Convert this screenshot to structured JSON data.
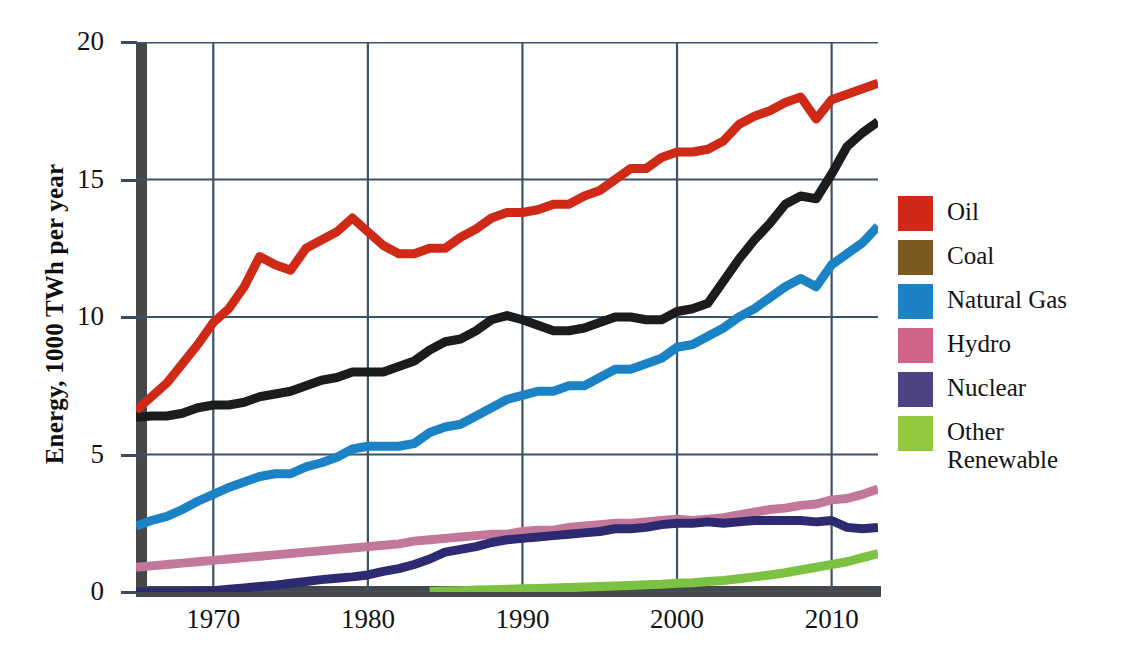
{
  "chart_data": {
    "type": "line",
    "title": "",
    "xlabel": "",
    "ylabel": "Energy, 1000 TWh per year",
    "xlim": [
      1965,
      2013
    ],
    "ylim": [
      0,
      20
    ],
    "grid": true,
    "legend_position": "right",
    "xticks": [
      "1970",
      "1980",
      "1990",
      "2000",
      "2010"
    ],
    "xtick_values": [
      1970,
      1980,
      1990,
      2000,
      2010
    ],
    "yticks": [
      "0",
      "5",
      "10",
      "15",
      "20"
    ],
    "ytick_values": [
      0,
      5,
      10,
      15,
      20
    ],
    "x": [
      1965,
      1966,
      1967,
      1968,
      1969,
      1970,
      1971,
      1972,
      1973,
      1974,
      1975,
      1976,
      1977,
      1978,
      1979,
      1980,
      1981,
      1982,
      1983,
      1984,
      1985,
      1986,
      1987,
      1988,
      1989,
      1990,
      1991,
      1992,
      1993,
      1994,
      1995,
      1996,
      1997,
      1998,
      1999,
      2000,
      2001,
      2002,
      2003,
      2004,
      2005,
      2006,
      2007,
      2008,
      2009,
      2010,
      2011,
      2012,
      2013
    ],
    "series": [
      {
        "name": "Oil",
        "color": "#cf2a18",
        "values": [
          6.6,
          7.1,
          7.6,
          8.3,
          9.0,
          9.8,
          10.3,
          11.1,
          12.2,
          11.9,
          11.7,
          12.5,
          12.8,
          13.1,
          13.6,
          13.1,
          12.6,
          12.3,
          12.3,
          12.5,
          12.5,
          12.9,
          13.2,
          13.6,
          13.8,
          13.8,
          13.9,
          14.1,
          14.1,
          14.4,
          14.6,
          15.0,
          15.4,
          15.4,
          15.8,
          16.0,
          16.0,
          16.1,
          16.4,
          17.0,
          17.3,
          17.5,
          17.8,
          18.0,
          17.2,
          17.9,
          18.1,
          18.3,
          18.5
        ]
      },
      {
        "name": "Coal",
        "color": "#1c1c1e",
        "values": [
          6.35,
          6.4,
          6.4,
          6.5,
          6.7,
          6.8,
          6.8,
          6.9,
          7.1,
          7.2,
          7.3,
          7.5,
          7.7,
          7.8,
          8.0,
          8.0,
          8.0,
          8.2,
          8.4,
          8.8,
          9.1,
          9.2,
          9.5,
          9.9,
          10.05,
          9.9,
          9.7,
          9.5,
          9.5,
          9.6,
          9.8,
          10.0,
          10.0,
          9.9,
          9.9,
          10.2,
          10.3,
          10.5,
          11.3,
          12.1,
          12.8,
          13.4,
          14.1,
          14.4,
          14.3,
          15.2,
          16.2,
          16.7,
          17.1
        ]
      },
      {
        "name": "Natural Gas",
        "color": "#1b82c5",
        "values": [
          2.4,
          2.6,
          2.75,
          3.0,
          3.3,
          3.55,
          3.8,
          4.0,
          4.2,
          4.3,
          4.3,
          4.55,
          4.7,
          4.9,
          5.2,
          5.3,
          5.3,
          5.3,
          5.4,
          5.8,
          6.0,
          6.1,
          6.4,
          6.7,
          7.0,
          7.15,
          7.3,
          7.3,
          7.5,
          7.5,
          7.8,
          8.1,
          8.1,
          8.3,
          8.5,
          8.9,
          9.0,
          9.3,
          9.6,
          10.0,
          10.3,
          10.7,
          11.1,
          11.4,
          11.1,
          11.9,
          12.3,
          12.7,
          13.3
        ]
      },
      {
        "name": "Hydro",
        "color": "#c2789b",
        "values": [
          0.9,
          0.95,
          1.0,
          1.05,
          1.1,
          1.15,
          1.2,
          1.25,
          1.3,
          1.35,
          1.4,
          1.45,
          1.5,
          1.55,
          1.6,
          1.65,
          1.7,
          1.75,
          1.85,
          1.9,
          1.95,
          2.0,
          2.05,
          2.1,
          2.1,
          2.2,
          2.25,
          2.25,
          2.35,
          2.4,
          2.45,
          2.5,
          2.5,
          2.55,
          2.6,
          2.65,
          2.6,
          2.65,
          2.7,
          2.8,
          2.9,
          3.0,
          3.05,
          3.15,
          3.2,
          3.35,
          3.4,
          3.55,
          3.75
        ]
      },
      {
        "name": "Nuclear",
        "color": "#2e2a72",
        "values": [
          0.0,
          0.0,
          0.0,
          0.0,
          0.02,
          0.05,
          0.1,
          0.15,
          0.2,
          0.25,
          0.32,
          0.38,
          0.45,
          0.5,
          0.55,
          0.62,
          0.75,
          0.85,
          1.0,
          1.2,
          1.45,
          1.55,
          1.65,
          1.8,
          1.9,
          1.95,
          2.0,
          2.05,
          2.1,
          2.15,
          2.2,
          2.3,
          2.3,
          2.35,
          2.45,
          2.5,
          2.5,
          2.55,
          2.5,
          2.55,
          2.6,
          2.6,
          2.6,
          2.6,
          2.55,
          2.6,
          2.35,
          2.3,
          2.35
        ]
      },
      {
        "name": "Other Renewable",
        "color": "#7cc242",
        "values": [
          null,
          null,
          null,
          null,
          null,
          null,
          null,
          null,
          null,
          null,
          null,
          null,
          null,
          null,
          null,
          null,
          null,
          null,
          null,
          0.02,
          0.04,
          0.05,
          0.07,
          0.08,
          0.1,
          0.12,
          0.13,
          0.15,
          0.16,
          0.18,
          0.2,
          0.22,
          0.24,
          0.26,
          0.28,
          0.32,
          0.34,
          0.38,
          0.42,
          0.48,
          0.55,
          0.62,
          0.7,
          0.8,
          0.9,
          1.0,
          1.1,
          1.25,
          1.4
        ]
      }
    ]
  },
  "axes": {
    "y_title": "Energy, 1000 TWh per year",
    "y_ticks": [
      {
        "label": "20",
        "value": 20
      },
      {
        "label": "15",
        "value": 15
      },
      {
        "label": "10",
        "value": 10
      },
      {
        "label": "5",
        "value": 5
      },
      {
        "label": "0",
        "value": 0
      }
    ],
    "x_ticks": [
      {
        "label": "1970",
        "value": 1970
      },
      {
        "label": "1980",
        "value": 1980
      },
      {
        "label": "1990",
        "value": 1990
      },
      {
        "label": "2000",
        "value": 2000
      },
      {
        "label": "2010",
        "value": 2010
      }
    ]
  },
  "legend": {
    "items": [
      {
        "label": "Oil",
        "color": "#cf2a18"
      },
      {
        "label": "Coal",
        "color": "#7a5a21"
      },
      {
        "label": "Natural Gas",
        "color": "#1b82c5"
      },
      {
        "label": "Hydro",
        "color": "#cf6285"
      },
      {
        "label": "Nuclear",
        "color": "#4e4283"
      },
      {
        "label": "Other\nRenewable",
        "color": "#93c83e"
      }
    ]
  },
  "style": {
    "grid_color": "#3c5268",
    "spine_color": "#46474a",
    "background": "#ffffff"
  }
}
